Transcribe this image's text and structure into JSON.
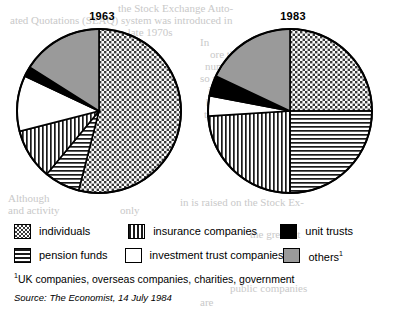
{
  "charts": [
    {
      "title": "1963"
    },
    {
      "title": "1983"
    }
  ],
  "legend": {
    "rows": [
      [
        {
          "key": "individuals",
          "label": "individuals",
          "pattern": "dots"
        },
        {
          "key": "insurance",
          "label": "insurance companies",
          "pattern": "vertical-lines"
        },
        {
          "key": "unit_trusts",
          "label": "unit trusts",
          "pattern": "solid-black"
        }
      ],
      [
        {
          "key": "pension",
          "label": "pension funds",
          "pattern": "horizontal-lines"
        },
        {
          "key": "investment",
          "label": "investment trust companies",
          "pattern": "white"
        },
        {
          "key": "others",
          "label": "others",
          "label_sup": "1",
          "pattern": "solid-gray"
        }
      ]
    ]
  },
  "footnote": {
    "marker": "1",
    "text": "UK companies, overseas companies, charities, government"
  },
  "source": "Source: The Economist, 14 July 1984",
  "colors": {
    "black": "#000000",
    "gray": "#9a9a9a",
    "white": "#ffffff",
    "outline": "#000000"
  },
  "background_text": {
    "lines": [
      {
        "text": "the Stock Exchange Auto-",
        "x": 118,
        "y": 2
      },
      {
        "text": "ated Quotations (SEAQ) system was introduced in",
        "x": 10,
        "y": 14
      },
      {
        "text": "during the late 1970s",
        "x": 80,
        "y": 26
      },
      {
        "text": "In",
        "x": 200,
        "y": 36
      },
      {
        "text": "ore than",
        "x": 210,
        "y": 48
      },
      {
        "text": "number",
        "x": 205,
        "y": 60
      },
      {
        "text": "so were",
        "x": 200,
        "y": 72
      },
      {
        "text": "in 1983",
        "x": 208,
        "y": 84
      },
      {
        "text": "by the",
        "x": 206,
        "y": 96
      },
      {
        "text": "to 1984",
        "x": 204,
        "y": 108
      },
      {
        "text": "Although",
        "x": 8,
        "y": 192
      },
      {
        "text": "and activity",
        "x": 8,
        "y": 204
      },
      {
        "text": "only",
        "x": 120,
        "y": 204
      },
      {
        "text": "in is raised on the Stock Ex-",
        "x": 180,
        "y": 196
      },
      {
        "text": "the greatest",
        "x": 250,
        "y": 228
      },
      {
        "text": "public companies",
        "x": 230,
        "y": 282
      },
      {
        "text": "are",
        "x": 200,
        "y": 296
      }
    ]
  },
  "chart_data": [
    {
      "type": "pie",
      "title": "1963",
      "labels": [
        "individuals",
        "pension funds",
        "insurance companies",
        "investment trust companies",
        "unit trusts",
        "others"
      ],
      "values": [
        54,
        7,
        10,
        11,
        2,
        16
      ],
      "units": "percent",
      "start_angle_deg": 0,
      "direction": "clockwise"
    },
    {
      "type": "pie",
      "title": "1983",
      "labels": [
        "individuals",
        "pension funds",
        "insurance companies",
        "investment trust companies",
        "unit trusts",
        "others"
      ],
      "values": [
        25,
        25,
        24,
        4,
        4,
        18
      ],
      "units": "percent",
      "start_angle_deg": 0,
      "direction": "clockwise"
    }
  ]
}
